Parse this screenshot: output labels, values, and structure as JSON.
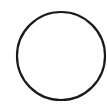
{
  "shape": {
    "type": "circle",
    "icon": "circle-outline-icon",
    "cx": 61,
    "cy": 56,
    "r": 44,
    "stroke": "#1a1a1a",
    "stroke_width": 2.2,
    "fill": "#ffffff"
  },
  "background": "#ffffff"
}
